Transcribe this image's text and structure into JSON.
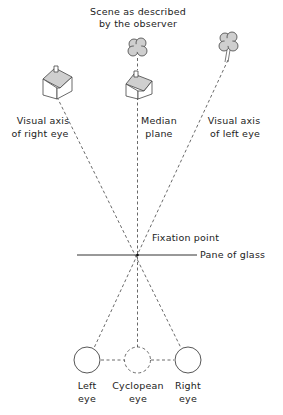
{
  "title_lines": [
    "Scene as described",
    "by the observer"
  ],
  "labels": {
    "right_axis": [
      "Visual axis",
      "of right eye"
    ],
    "median": [
      "Median",
      "plane"
    ],
    "left_axis": [
      "Visual axis",
      "of left eye"
    ],
    "fixation": "Fixation point",
    "glass": "Pane of glass",
    "left_eye": [
      "Left",
      "eye"
    ],
    "cyclopean_eye": [
      "Cyclopean",
      "eye"
    ],
    "right_eye": [
      "Right",
      "eye"
    ]
  },
  "objects": [
    {
      "type": "house",
      "position": "left"
    },
    {
      "type": "house",
      "position": "center"
    },
    {
      "type": "tree",
      "position": "center"
    },
    {
      "type": "tree",
      "position": "right"
    }
  ],
  "colors": {
    "line": "#333333",
    "fill": "#cfcfcf"
  }
}
